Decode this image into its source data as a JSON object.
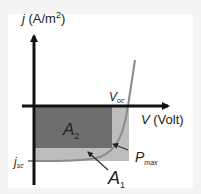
{
  "diagram": {
    "type": "solar-cell-jv-curve",
    "y_axis": {
      "symbol": "j",
      "unit_prefix": " (A/m",
      "unit_sup": "2",
      "unit_suffix": ")"
    },
    "x_axis": {
      "symbol": "V",
      "unit": " (Volt)"
    },
    "labels": {
      "voc_main": "V",
      "voc_sub": "oc",
      "jsc_main": "j",
      "jsc_sub": "sc",
      "pmax_main": "P",
      "pmax_sub": "max",
      "a1_main": "A",
      "a1_sub": "1",
      "a2_main": "A",
      "a2_sub": "2"
    },
    "colors": {
      "axis": "#111111",
      "area_a2": "#6e6e6e",
      "area_a1": "#bdbdbd",
      "curve": "#8a8a8a",
      "annotation": "#333333"
    }
  }
}
